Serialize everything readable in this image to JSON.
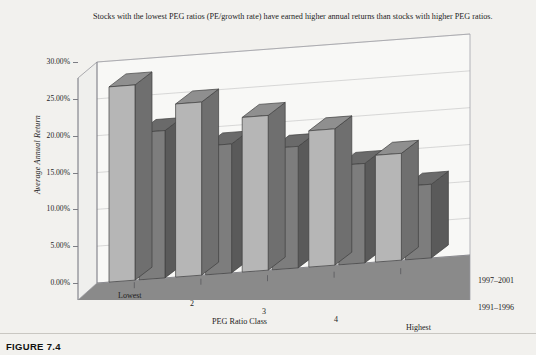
{
  "caption": {
    "top_note": "Stocks with the lowest PEG ratios (PE/growth rate) have earned higher annual returns than stocks with higher PEG ratios.",
    "figure_label": "FIGURE 7.4"
  },
  "colors": {
    "page_background": "#f2f1ee",
    "plot_floor": "#8a8a8a",
    "back_wall": "#f7f7f5",
    "series_front_face": "#b6b6b6",
    "series_front_side": "#6f6f6f",
    "series_front_top": "#8f8f8f",
    "series_back_face": "#7d7d7d",
    "series_back_side": "#5a5a5a",
    "series_back_top": "#6a6a6a",
    "axis_line": "#6d6d72",
    "gridline": "#c4c4c4"
  },
  "chart_data": {
    "type": "bar",
    "title": "",
    "subtitle": "",
    "xlabel": "PEG Ratio Class",
    "ylabel": "Average Annual Return",
    "categories": [
      "Lowest",
      "2",
      "3",
      "4",
      "Highest"
    ],
    "series": [
      {
        "name": "1997–2001",
        "values": [
          26.5,
          23.5,
          21.0,
          18.5,
          14.5
        ]
      },
      {
        "name": "1991–1996",
        "values": [
          20.0,
          17.5,
          16.5,
          13.5,
          10.0
        ]
      }
    ],
    "ylim": [
      0,
      30
    ],
    "ytick_values": [
      0,
      5,
      10,
      15,
      20,
      25,
      30
    ],
    "ytick_labels": [
      "0.00%",
      "5.00%",
      "10.00%",
      "15.00%",
      "20.00%",
      "25.00%",
      "30.00%"
    ],
    "value_format": "percent",
    "grid": true,
    "legend_position": "right-depth-axis",
    "projection": "3d"
  }
}
